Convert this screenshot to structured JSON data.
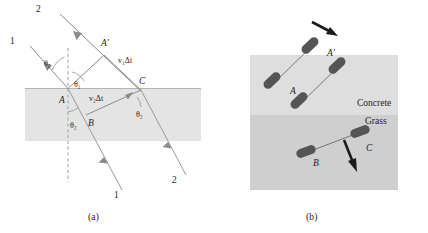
{
  "figure": {
    "captions": {
      "a": "(a)",
      "b": "(b)"
    }
  },
  "panel_a": {
    "name": "wavefront-refraction-diagram",
    "description": "Two parallel incident rays 1 and 2 strike a horizontal boundary and refract, with wavefronts AA' and BC drawn.",
    "rays": {
      "incident_top_label": "2",
      "incident_lower_label": "1",
      "refracted_lower_label": "1",
      "refracted_right_label": "2"
    },
    "points": {
      "a_prime": "A′",
      "a": "A",
      "b": "B",
      "c": "C"
    },
    "angles": {
      "theta1_upper": "θ₁",
      "theta1_lower": "θ₁",
      "theta2_normal": "θ₂",
      "theta2_right": "θ₂"
    },
    "distances": {
      "v1dt": "v₁Δt",
      "v2dt": "v₂Δt"
    },
    "media": {
      "upper_label": "",
      "lower_label": ""
    },
    "colors": {
      "medium_shade": "#e4e4e4",
      "ray": "#8d8d8d",
      "normal": "#a8a8a8",
      "interface": "#b4b4b4"
    }
  },
  "panel_b": {
    "name": "wheel-axle-analogy-diagram",
    "description": "A rolling wheel-and-axle crosses from concrete onto grass, slowing and turning, analogous to refraction.",
    "surfaces": {
      "upper_label": "Concrete",
      "lower_label": "Grass"
    },
    "points": {
      "a": "A",
      "a_prime": "A′",
      "b": "B",
      "c": "C"
    },
    "colors": {
      "concrete": "#dedede",
      "grass": "#cfcfcf",
      "wheel": "#555555",
      "axle": "#d8d8d8",
      "arrow": "#1b1b1b"
    }
  }
}
